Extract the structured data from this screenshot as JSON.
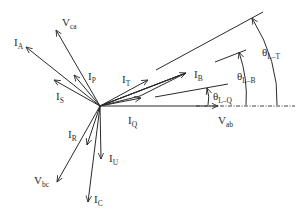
{
  "diagram": {
    "type": "phasor-diagram",
    "origin": [
      100,
      106
    ],
    "vectors": [
      {
        "id": "V_ab",
        "main": "V",
        "sub": "ab",
        "end": [
          218,
          106
        ],
        "label_pos": [
          218,
          124
        ]
      },
      {
        "id": "V_ca",
        "main": "V",
        "sub": "ca",
        "end": [
          56,
          30
        ],
        "label_pos": [
          62,
          26
        ]
      },
      {
        "id": "V_bc",
        "main": "V",
        "sub": "bc",
        "end": [
          57,
          182
        ],
        "label_pos": [
          34,
          184
        ]
      },
      {
        "id": "I_A",
        "main": "I",
        "sub": "A",
        "end": [
          26,
          47
        ],
        "label_pos": [
          14,
          46
        ]
      },
      {
        "id": "I_B",
        "main": "I",
        "sub": "B",
        "end": [
          186,
          73
        ],
        "label_pos": [
          194,
          78
        ]
      },
      {
        "id": "I_C",
        "main": "I",
        "sub": "C",
        "end": [
          88,
          202
        ],
        "label_pos": [
          94,
          203
        ]
      },
      {
        "id": "I_P",
        "main": "I",
        "sub": "P",
        "end": [
          74,
          75
        ],
        "label_pos": [
          88,
          80
        ]
      },
      {
        "id": "I_S",
        "main": "I",
        "sub": "S",
        "end": [
          54,
          80
        ],
        "label_pos": [
          56,
          100
        ]
      },
      {
        "id": "I_T",
        "main": "I",
        "sub": "T",
        "end": [
          148,
          80
        ],
        "label_pos": [
          122,
          83
        ]
      },
      {
        "id": "I_Q",
        "main": "I",
        "sub": "Q",
        "end": [
          141,
          98
        ],
        "label_pos": [
          128,
          124
        ]
      },
      {
        "id": "I_R",
        "main": "I",
        "sub": "R",
        "end": [
          87,
          145
        ],
        "label_pos": [
          68,
          138
        ]
      },
      {
        "id": "I_U",
        "main": "I",
        "sub": "U",
        "end": [
          101,
          159
        ],
        "label_pos": [
          109,
          162
        ]
      }
    ],
    "extra_arrows_to_IB": [
      {
        "from": [
          100,
          106
        ],
        "to": [
          186,
          73
        ]
      },
      {
        "from": [
          100,
          106
        ],
        "to": [
          186,
          73
        ]
      }
    ],
    "reference_line": {
      "from": [
        196,
        106
      ],
      "to": [
        295,
        106
      ],
      "style": "dash-dot"
    },
    "angle_lines": [
      {
        "id": "L-Q",
        "line": [
          [
            155,
            97
          ],
          [
            228,
            84
          ]
        ],
        "arc_x": 208,
        "arrow_tip": [
          207,
          88
        ]
      },
      {
        "id": "L-B",
        "line": [
          [
            215,
            62
          ],
          [
            246,
            50
          ]
        ],
        "arc_x": 246,
        "arrow_tip": [
          239,
          52
        ]
      },
      {
        "id": "L-T",
        "line": [
          [
            156,
            70
          ],
          [
            263,
            12
          ]
        ],
        "arc_x": 277,
        "arrow_tip": [
          252,
          18
        ]
      }
    ],
    "angle_labels": [
      {
        "main": "θ",
        "sub": "L–Q",
        "pos": [
          213,
          100
        ]
      },
      {
        "main": "θ",
        "sub": "L–B",
        "pos": [
          237,
          80
        ]
      },
      {
        "main": "θ",
        "sub": "L–T",
        "pos": [
          262,
          56
        ]
      }
    ],
    "colors": {
      "line": "#2a2a2a",
      "background": "#ffffff"
    }
  }
}
